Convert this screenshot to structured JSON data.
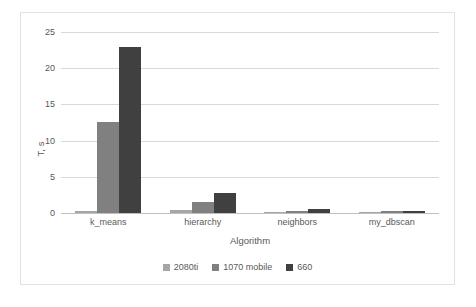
{
  "chart_data": {
    "type": "bar",
    "title": "",
    "xlabel": "Algorithm",
    "ylabel": "T, s",
    "categories": [
      "k_means",
      "hierarchy",
      "neighbors",
      "my_dbscan"
    ],
    "series": [
      {
        "name": "2080ti",
        "color": "#a6a6a6",
        "values": [
          0.3,
          0.4,
          0.2,
          0.2
        ]
      },
      {
        "name": "1070 mobile",
        "color": "#808080",
        "values": [
          12.6,
          1.5,
          0.3,
          0.25
        ]
      },
      {
        "name": "660",
        "color": "#404040",
        "values": [
          22.9,
          2.7,
          0.6,
          0.3
        ]
      }
    ],
    "ylim": [
      0,
      25
    ],
    "yticks": [
      0,
      5,
      10,
      15,
      20,
      25
    ],
    "ytick_labels": [
      "0",
      "5",
      "10",
      "15",
      "20",
      "25"
    ],
    "grid": true,
    "legend_position": "bottom",
    "colors": {
      "gridline": "#d9d9d9",
      "axis": "#bfbfbf",
      "text": "#595959",
      "frame": "#e2e2e2",
      "background": "#ffffff"
    }
  }
}
